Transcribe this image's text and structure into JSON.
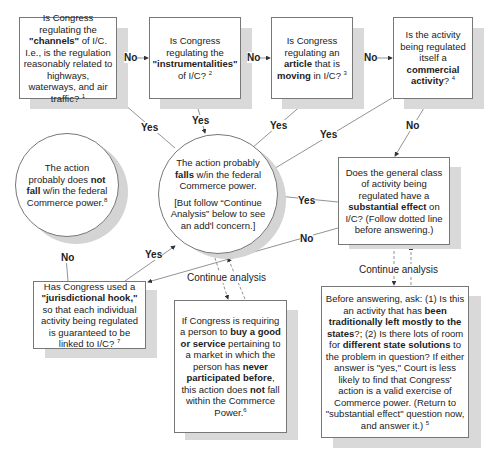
{
  "nodes": {
    "channels": {
      "pre": "Is Congress regulating the ",
      "bold": "\"channels\"",
      "post": " of I/C. I.e., is the regulation reasonably related to highways, waterways, and air traffic?",
      "footnote": "1"
    },
    "instrumentalities": {
      "pre": "Is Congress regulating the ",
      "bold": "\"instrumentalities\"",
      "post": " of I/C?",
      "footnote": "2"
    },
    "article": {
      "pre": "Is Congress regulating an ",
      "bold1": "article",
      "mid": " that is ",
      "bold2": "moving",
      "post": " in I/C?",
      "footnote": "3"
    },
    "commercial": {
      "pre": "Is the activity being regulated itself a ",
      "bold": "commercial activity",
      "post": "?",
      "footnote": "4"
    },
    "falls_within": {
      "line1_pre": "The action probably ",
      "line1_bold": "falls",
      "line1_post": " w/in the federal Commerce power.",
      "line2": "[But follow “Continue Analysis” below to see an add'l concern.]"
    },
    "not_fall": {
      "pre": "The action probably does ",
      "bold": "not fall",
      "post": " w/in the federal Commerce power.",
      "footnote": "8"
    },
    "substantial_effect": {
      "pre": "Does the general class of activity being regulated have a ",
      "bold": "substantial effect",
      "post": " on I/C? (Follow dotted line before answering.)"
    },
    "jurisdictional_hook": {
      "pre": "Has Congress used a ",
      "bold": "\"jurisdictional hook,\"",
      "post": " so that each individual activity being regulated is guaranteed to be linked to I/C?",
      "footnote": "7"
    },
    "buy_good": {
      "pre": "If Congress is requiring a person to ",
      "bold1": "buy a good or service",
      "mid": " pertaining to a market in which the person has ",
      "bold2": "never participated before",
      "mid2": ", this action does ",
      "bold3": "not",
      "post": " fall within the Commerce Power.",
      "footnote": "6"
    },
    "before_answering": {
      "pre": "Before answering, ask: (1) Is this an activity that has ",
      "bold1": "been traditionally left mostly to the states",
      "mid": "?; (2) Is there lots of room for ",
      "bold2": "different state solutions",
      "post": " to the problem in question? If either answer is \"yes,\" Court is less likely to find that Congress' action is a valid exercise of Commerce power. (Return to \"substantial effect\" question now, and answer it.)",
      "footnote": "5"
    }
  },
  "edges": {
    "no": "No",
    "yes": "Yes",
    "continue": "Continue analysis"
  },
  "colors": {
    "border": "#777777",
    "shadow": "#d9d9d9",
    "line": "#777777"
  }
}
